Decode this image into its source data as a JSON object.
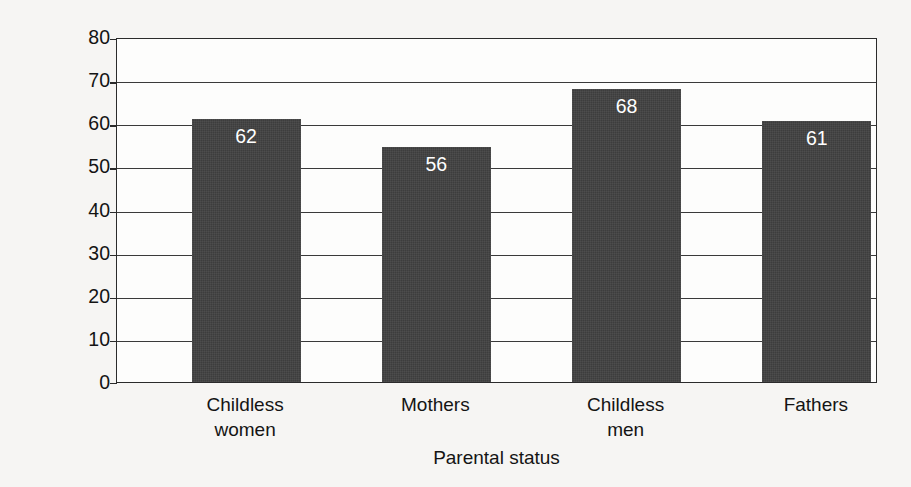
{
  "chart_data": {
    "type": "bar",
    "title": "",
    "categories": [
      "Childless women",
      "Mothers",
      "Childless men",
      "Fathers"
    ],
    "category_lines": [
      [
        "Childless",
        "women"
      ],
      [
        "Mothers"
      ],
      [
        "Childless",
        "men"
      ],
      [
        "Fathers"
      ]
    ],
    "values": [
      62,
      56,
      68,
      61
    ],
    "bar_heights": [
      61,
      54.5,
      68,
      60.5
    ],
    "data_labels": [
      "62",
      "56",
      "68",
      "61"
    ],
    "xlabel": "Parental status",
    "ylabel": "Hours per week",
    "ylim": [
      0,
      80
    ],
    "ytick_values": [
      0,
      10,
      20,
      30,
      40,
      50,
      60,
      70,
      80
    ],
    "ytick_labels": [
      "0",
      "10",
      "20",
      "30",
      "40",
      "50",
      "60",
      "70",
      "80"
    ],
    "grid": "horizontal",
    "legend": "none",
    "bar_color": "#3d3d3d",
    "data_label_color": "#ffffff",
    "plot_background": "#fdfdfc",
    "axis_color": "#2b2b2b",
    "page_background": "#f6f5f3"
  }
}
